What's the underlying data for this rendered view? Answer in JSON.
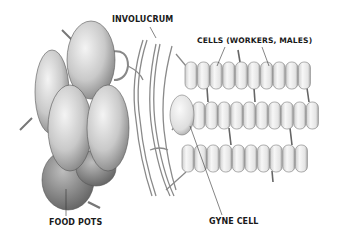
{
  "diagram": {
    "labels": {
      "involucrum": "INVOLUCRUM",
      "cells": "CELLS (WORKERS, MALES)",
      "food_pots": "FOOD POTS",
      "gyne_cell": "GYNE CELL"
    },
    "colors": {
      "ink": "#1a1a1a",
      "shade_dark": "#6e6e6e",
      "shade_mid": "#a8a8a8",
      "shade_light": "#e6e6e6",
      "background": "#ffffff"
    },
    "cell_rows": [
      {
        "y": 62,
        "x_start": 185,
        "count": 10,
        "cell_w": 12.6,
        "cell_h": 27
      },
      {
        "y": 102,
        "x_start": 195,
        "count": 10,
        "cell_w": 12.6,
        "cell_h": 27
      },
      {
        "y": 145,
        "x_start": 182,
        "count": 10,
        "cell_w": 12.6,
        "cell_h": 27
      }
    ]
  }
}
